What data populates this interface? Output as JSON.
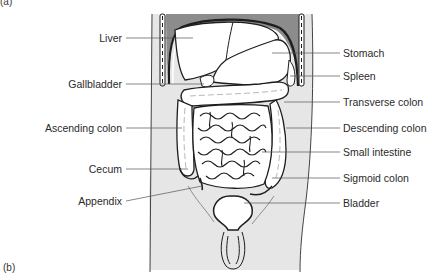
{
  "figure": {
    "panel_top_label": "(a)",
    "panel_bottom_label": "(b)",
    "colors": {
      "body_fill": "#e6e6e6",
      "diaphragm_fill": "#8c8c8c",
      "organ_fill": "#ffffff",
      "outline": "#1e1e1e",
      "leader_line": "#555555",
      "text": "#2a2a2a"
    },
    "labels_left": [
      {
        "text": "Liver",
        "x": 122,
        "y": 38
      },
      {
        "text": "Gallbladder",
        "x": 122,
        "y": 84
      },
      {
        "text": "Ascending colon",
        "x": 122,
        "y": 128
      },
      {
        "text": "Cecum",
        "x": 122,
        "y": 169
      },
      {
        "text": "Appendix",
        "x": 122,
        "y": 201
      }
    ],
    "labels_right": [
      {
        "text": "Stomach",
        "x": 343,
        "y": 53
      },
      {
        "text": "Spleen",
        "x": 343,
        "y": 76
      },
      {
        "text": "Transverse colon",
        "x": 343,
        "y": 102
      },
      {
        "text": "Descending colon",
        "x": 343,
        "y": 128
      },
      {
        "text": "Small intestine",
        "x": 343,
        "y": 152
      },
      {
        "text": "Sigmoid colon",
        "x": 343,
        "y": 178
      },
      {
        "text": "Bladder",
        "x": 343,
        "y": 203
      }
    ]
  }
}
